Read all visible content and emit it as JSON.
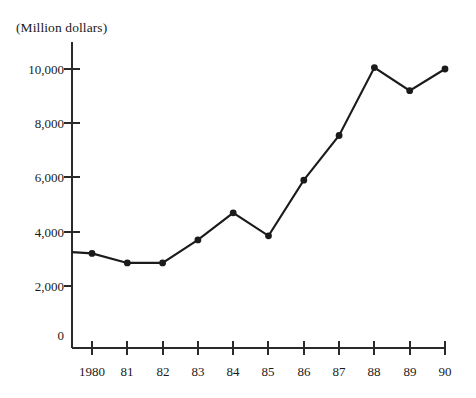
{
  "chart_data": {
    "type": "line",
    "title": "(Million dollars)",
    "xlabel": "",
    "ylabel": "(Million dollars)",
    "categories": [
      "1980",
      "81",
      "82",
      "83",
      "84",
      "85",
      "86",
      "87",
      "88",
      "89",
      "90"
    ],
    "x": [
      1980,
      1981,
      1982,
      1983,
      1984,
      1985,
      1986,
      1987,
      1988,
      1989,
      1990
    ],
    "values": [
      3200,
      2850,
      2850,
      3700,
      4700,
      3850,
      5900,
      7550,
      10050,
      9200,
      10000
    ],
    "series": [
      {
        "name": "(Million dollars)",
        "values": [
          3200,
          2850,
          2850,
          3700,
          4700,
          3850,
          5900,
          7550,
          10050,
          9200,
          10000
        ]
      }
    ],
    "ylim": [
      0,
      11000
    ],
    "ytick_values": [
      0,
      2000,
      4000,
      6000,
      8000,
      10000
    ],
    "ytick_labels": [
      "0",
      "2,000",
      "4,000",
      "6,000",
      "8,000",
      "10,000"
    ],
    "xtick_labels": [
      "1980",
      "81",
      "82",
      "83",
      "84",
      "85",
      "86",
      "87",
      "88",
      "89",
      "90"
    ],
    "grid": false,
    "legend": "none",
    "marker": "filled-circle",
    "line_color": "#1b1b1b",
    "axis_color": "#2a2a2a",
    "background_color": "#ffffff",
    "leader_from_axis_value": 3250
  },
  "labels": {
    "title": "(Million dollars)",
    "y0": "0",
    "y2000": "2,000",
    "y4000": "4,000",
    "y6000": "6,000",
    "y8000": "8,000",
    "y10000": "10,000",
    "x1980": "1980",
    "x81": "81",
    "x82": "82",
    "x83": "83",
    "x84": "84",
    "x85": "85",
    "x86": "86",
    "x87": "87",
    "x88": "88",
    "x89": "89",
    "x90": "90"
  }
}
